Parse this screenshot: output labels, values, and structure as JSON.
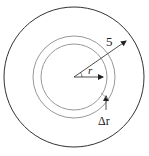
{
  "diagram": {
    "type": "concentric-circles",
    "outer_circle": {
      "cx": 74,
      "cy": 77,
      "r": 70,
      "stroke": "#333333"
    },
    "ring_outer": {
      "cx": 74,
      "cy": 77,
      "r": 41,
      "stroke": "#999999"
    },
    "ring_inner": {
      "cx": 74,
      "cy": 77,
      "r": 33,
      "stroke": "#999999"
    },
    "labels": {
      "outer_radius": "5",
      "inner_radius": "r",
      "thickness": "Δr"
    }
  }
}
